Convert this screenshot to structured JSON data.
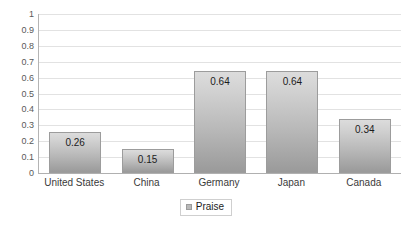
{
  "chart_data": {
    "type": "bar",
    "title": "",
    "subtitle": "",
    "xlabel": "",
    "ylabel": "",
    "categories": [
      "United States",
      "China",
      "Germany",
      "Japan",
      "Canada"
    ],
    "values": [
      0.26,
      0.15,
      0.64,
      0.64,
      0.34
    ],
    "value_labels": [
      "0.26",
      "0.15",
      "0.64",
      "0.64",
      "0.34"
    ],
    "series": [
      {
        "name": "Praise",
        "values": [
          0.26,
          0.15,
          0.64,
          0.64,
          0.34
        ]
      }
    ],
    "ylim": [
      0,
      1
    ],
    "ytick_step": 0.1,
    "ytick_labels": [
      "1",
      "0.9",
      "0.8",
      "0.7",
      "0.6",
      "0.5",
      "0.4",
      "0.3",
      "0.2",
      "0.1",
      "0"
    ],
    "ytick_values": [
      1,
      0.9,
      0.8,
      0.7,
      0.6,
      0.5,
      0.4,
      0.3,
      0.2,
      0.1,
      0
    ],
    "grid": true,
    "grid_axis": "y",
    "legend_position": "bottom",
    "legend_entries": [
      "Praise"
    ],
    "colors": {
      "bar_gradient_top": "#dcdcdc",
      "bar_gradient_bottom": "#9a9a9a",
      "bar_outline": "#9c9c9c",
      "gridline": "#e2e2e2",
      "axis": "#b0b0b0",
      "tick_text": "#595959",
      "label_text": "#1c1c1c",
      "background": "#ffffff",
      "legend_border": "#cfcfcf",
      "legend_swatch": "#b9b9b9"
    }
  }
}
